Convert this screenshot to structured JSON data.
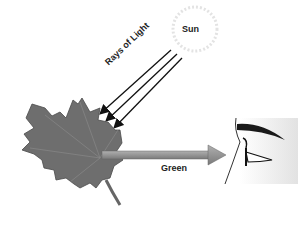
{
  "diagram": {
    "labels": {
      "sun": "Sun",
      "rays": "Rays of Light",
      "reflected": "Green"
    },
    "colors": {
      "leaf": "#6e6e6e",
      "arrow": "#8a8a8a",
      "rays": "#111111",
      "sun_outline": "#dddddd"
    }
  }
}
